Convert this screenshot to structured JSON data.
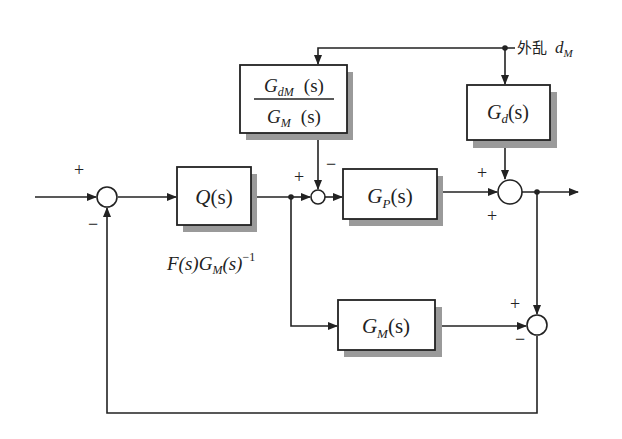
{
  "diagram": {
    "type": "block-diagram",
    "blocks": [
      {
        "id": "Q",
        "label": "Q(s)",
        "label_base": "Q",
        "label_arg": "(s)"
      },
      {
        "id": "GP",
        "label": "G_P(s)",
        "label_base": "G",
        "label_sub": "P",
        "label_arg": "(s)"
      },
      {
        "id": "GM",
        "label": "G_M(s)",
        "label_base": "G",
        "label_sub": "M",
        "label_arg": "(s)"
      },
      {
        "id": "Gd",
        "label": "G_d(s)",
        "label_base": "G",
        "label_sub": "d",
        "label_arg": "(s)"
      },
      {
        "id": "GdM_over_GM",
        "label": "G_dM(s) / G_M(s)",
        "num_base": "G",
        "num_sub": "dM",
        "num_arg": "(s)",
        "den_base": "G",
        "den_sub": "M",
        "den_arg": "(s)"
      }
    ],
    "annotations": {
      "q_formula": {
        "f": "F(s)",
        "g": "G",
        "g_sub": "M",
        "g_arg": "(s)",
        "exp": "−1"
      },
      "disturbance": {
        "cjk": "外乱",
        "sym": "d",
        "sym_sub": "M"
      }
    },
    "signs": {
      "sum1_top": "+",
      "sum1_bottom": "−",
      "sum2_left": "+",
      "sum2_top": "−",
      "sum3_top": "+",
      "sum3_bottom": "+",
      "sum4_top": "+",
      "sum4_bottom": "−"
    }
  }
}
